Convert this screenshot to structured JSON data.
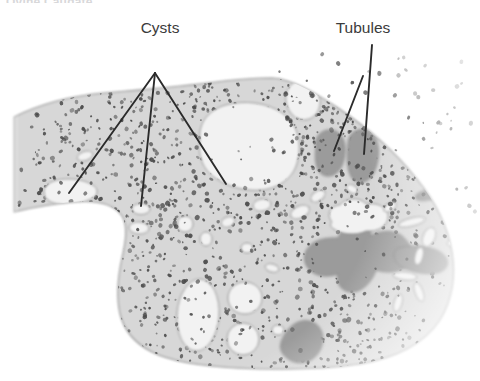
{
  "figure": {
    "title": "Ovine Caudate",
    "background_color": "#ffffff",
    "tissue_color": "#d7d7d7",
    "tissue_edge_color": "#8e8e8e",
    "cyst_color": "#f2f2f2",
    "tubule_color": "#9b9b9b",
    "tubule_edge_color": "#7a7a7a",
    "speckle_color": "#4a4a4a",
    "leader_color": "#2b2b2b",
    "label_color": "#3b3b3b"
  },
  "callouts": [
    {
      "id": "cysts",
      "label": "Cysts",
      "label_x": 160,
      "label_y": 33,
      "pivot_x": 155,
      "pivot_y": 73,
      "leaders": [
        {
          "name": "leader-cyst-left",
          "x1": 155,
          "y1": 73,
          "x2": 69,
          "y2": 193
        },
        {
          "name": "leader-cyst-middle",
          "x1": 155,
          "y1": 73,
          "x2": 141,
          "y2": 206
        },
        {
          "name": "leader-cyst-right",
          "x1": 155,
          "y1": 73,
          "x2": 226,
          "y2": 184
        }
      ]
    },
    {
      "id": "tubules",
      "label": "Tubules",
      "label_x": 363,
      "label_y": 33,
      "pivot_x": 363,
      "pivot_y": 76,
      "leaders": [
        {
          "name": "leader-tubule-left",
          "x1": 363,
          "y1": 76,
          "x2": 334,
          "y2": 151
        },
        {
          "name": "leader-tubule-right",
          "x1": 372,
          "y1": 45,
          "x2": 364,
          "y2": 154
        }
      ]
    }
  ],
  "tissue": {
    "name": "tissue-section",
    "outline": "M 14,117 C 40,104 70,96 104,93 C 140,90 176,87 208,83 C 238,79 258,78 272,78 C 292,79 314,92 338,108 C 362,124 392,148 416,178 C 436,202 448,228 452,252 C 456,276 452,300 440,320 C 424,344 396,358 360,364 C 320,370 276,370 236,368 C 200,366 172,362 152,352 C 134,343 124,330 120,314 C 116,296 118,276 122,258 C 126,240 128,226 122,216 C 114,204 96,200 74,202 C 52,204 30,208 14,212 Z"
  },
  "cysts": [
    {
      "name": "cyst-large-central",
      "type": "path",
      "d": "M 200,140 C 198,124 208,110 226,105 C 248,99 274,104 288,118 C 300,130 302,150 296,166 C 290,182 272,192 250,190 C 228,188 210,178 203,164 C 199,155 199,147 200,140 Z"
    },
    {
      "name": "cyst-upper-right-round",
      "type": "ellipse",
      "cx": 303,
      "cy": 100,
      "rx": 17,
      "ry": 20,
      "rot": -12
    },
    {
      "name": "cyst-left-kidney",
      "type": "path",
      "d": "M 44,192 C 44,184 54,179 68,179 C 80,179 88,182 94,186 C 98,189 98,194 94,197 C 86,203 70,206 58,204 C 48,202 44,198 44,192 Z"
    },
    {
      "name": "cyst-small-upper-left",
      "type": "ellipse",
      "cx": 85,
      "cy": 156,
      "rx": 8,
      "ry": 4.5,
      "rot": -18
    },
    {
      "name": "cyst-small-mid",
      "type": "ellipse",
      "cx": 141,
      "cy": 209,
      "rx": 9,
      "ry": 5.5,
      "rot": 0
    },
    {
      "name": "cyst-small-mid-lower",
      "type": "ellipse",
      "cx": 139,
      "cy": 228,
      "rx": 10,
      "ry": 6,
      "rot": 4
    },
    {
      "name": "cyst-mid-round-a",
      "type": "ellipse",
      "cx": 185,
      "cy": 224,
      "rx": 8,
      "ry": 8
    },
    {
      "name": "cyst-mid-round-b",
      "type": "ellipse",
      "cx": 206,
      "cy": 239,
      "rx": 6,
      "ry": 7
    },
    {
      "name": "cyst-mid-small-c",
      "type": "ellipse",
      "cx": 228,
      "cy": 222,
      "rx": 7,
      "ry": 5,
      "rot": -20
    },
    {
      "name": "cyst-mid-small-d",
      "type": "ellipse",
      "cx": 247,
      "cy": 248,
      "rx": 6,
      "ry": 5
    },
    {
      "name": "cyst-mid-small-e",
      "type": "ellipse",
      "cx": 272,
      "cy": 268,
      "rx": 7,
      "ry": 4,
      "rot": 15
    },
    {
      "name": "cyst-upper-mid-f",
      "type": "ellipse",
      "cx": 262,
      "cy": 205,
      "rx": 9,
      "ry": 6,
      "rot": -10
    },
    {
      "name": "cyst-upper-mid-g",
      "type": "ellipse",
      "cx": 300,
      "cy": 212,
      "rx": 10,
      "ry": 6,
      "rot": -25
    },
    {
      "name": "cyst-upper-mid-h",
      "type": "ellipse",
      "cx": 318,
      "cy": 196,
      "rx": 8,
      "ry": 5,
      "rot": -35
    },
    {
      "name": "cyst-oval-large-bottom",
      "type": "ellipse",
      "cx": 198,
      "cy": 315,
      "rx": 21,
      "ry": 36,
      "rot": 4
    },
    {
      "name": "cyst-round-bottom-a",
      "type": "ellipse",
      "cx": 245,
      "cy": 298,
      "rx": 17,
      "ry": 16
    },
    {
      "name": "cyst-round-bottom-b",
      "type": "ellipse",
      "cx": 243,
      "cy": 339,
      "rx": 16,
      "ry": 16
    },
    {
      "name": "cyst-bottom-small-c",
      "type": "ellipse",
      "cx": 278,
      "cy": 330,
      "rx": 6,
      "ry": 5
    },
    {
      "name": "cyst-cloud-right",
      "type": "path",
      "d": "M 332,222 C 326,214 330,206 340,205 C 346,197 360,197 366,204 C 378,202 388,208 388,216 C 388,226 378,232 366,231 C 356,236 340,234 334,229 C 330,227 330,224 332,222 Z"
    },
    {
      "name": "cyst-right-sliver-a",
      "type": "ellipse",
      "cx": 412,
      "cy": 222,
      "rx": 14,
      "ry": 4,
      "rot": -14
    },
    {
      "name": "cyst-right-sliver-b",
      "type": "ellipse",
      "cx": 429,
      "cy": 237,
      "rx": 6,
      "ry": 10,
      "rot": 22
    },
    {
      "name": "cyst-right-sliver-c",
      "type": "ellipse",
      "cx": 419,
      "cy": 256,
      "rx": 4,
      "ry": 9,
      "rot": 14
    },
    {
      "name": "cyst-right-sliver-d",
      "type": "ellipse",
      "cx": 405,
      "cy": 276,
      "rx": 12,
      "ry": 4,
      "rot": 6
    },
    {
      "name": "cyst-right-sliver-e",
      "type": "ellipse",
      "cx": 419,
      "cy": 292,
      "rx": 4,
      "ry": 10,
      "rot": -20
    },
    {
      "name": "cyst-right-sliver-f",
      "type": "ellipse",
      "cx": 398,
      "cy": 303,
      "rx": 4,
      "ry": 9,
      "rot": 16
    },
    {
      "name": "cyst-right-top-g",
      "type": "ellipse",
      "cx": 390,
      "cy": 207,
      "rx": 7,
      "ry": 4,
      "rot": -30
    },
    {
      "name": "cyst-far-right-h",
      "type": "ellipse",
      "cx": 452,
      "cy": 243,
      "rx": 5,
      "ry": 3,
      "rot": -10
    },
    {
      "name": "cyst-upper-right-i",
      "type": "ellipse",
      "cx": 352,
      "cy": 189,
      "rx": 6,
      "ry": 4,
      "rot": 30
    }
  ],
  "tubules": [
    {
      "name": "tubule-left-blob",
      "type": "path",
      "d": "M 316,148 C 314,138 320,130 330,130 C 340,130 346,140 345,152 C 344,166 338,176 328,176 C 318,176 314,164 316,148 Z"
    },
    {
      "name": "tubule-right-blob",
      "type": "path",
      "d": "M 348,144 C 348,134 356,128 365,130 C 375,132 380,144 378,158 C 376,174 368,184 358,182 C 348,180 346,162 348,144 Z"
    },
    {
      "name": "tubule-branching-mass",
      "type": "path",
      "d": "M 338,238 C 344,226 352,218 360,218 C 368,218 372,226 370,236 C 382,230 394,230 402,236 C 412,244 414,256 408,264 C 402,272 388,274 376,270 C 372,282 362,292 352,292 C 342,292 336,284 338,274 C 326,278 314,276 308,268 C 302,260 304,250 312,244 C 320,238 330,238 338,238 Z"
    },
    {
      "name": "tubule-right-tail",
      "type": "path",
      "d": "M 398,248 C 412,244 430,246 440,252 C 450,258 450,268 440,272 C 428,276 410,272 400,266 C 392,260 392,251 398,248 Z"
    },
    {
      "name": "tubule-bottom-dark",
      "type": "path",
      "d": "M 284,336 C 290,324 302,318 312,322 C 322,326 326,338 320,350 C 314,362 300,366 290,360 C 280,354 278,346 284,336 Z"
    },
    {
      "name": "tubule-bar-right",
      "type": "ellipse",
      "cx": 428,
      "cy": 195,
      "rx": 13,
      "ry": 5,
      "rot": -12
    }
  ]
}
